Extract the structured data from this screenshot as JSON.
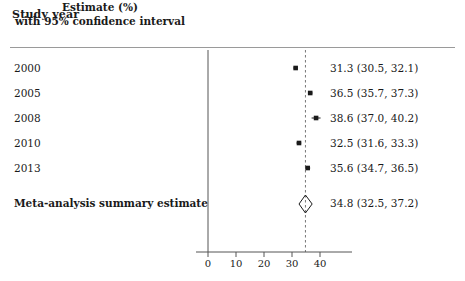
{
  "header": {
    "left_title": "Study year",
    "right_title_line1": "Estimate (%)",
    "right_title_line2": "with 95% confidence interval"
  },
  "chart_data": {
    "type": "forest",
    "title": "",
    "xlabel": "",
    "ylabel": "",
    "xlim": [
      -2,
      48
    ],
    "ticks": [
      0,
      10,
      20,
      30,
      40
    ],
    "tick_labels": [
      "0",
      "10",
      "20",
      "30",
      "40"
    ],
    "grid": false,
    "legend": "none",
    "reference_line_solid": 0,
    "reference_line_dashed": 34.8,
    "row_header": "Study year",
    "value_header": "Estimate (%) with 95% confidence interval",
    "rows": [
      {
        "label": "2000",
        "estimate": 31.3,
        "ci_low": 30.5,
        "ci_high": 32.1,
        "value_text": "31.3 (30.5, 32.1)",
        "marker": "square"
      },
      {
        "label": "2005",
        "estimate": 36.5,
        "ci_low": 35.7,
        "ci_high": 37.3,
        "value_text": "36.5 (35.7, 37.3)",
        "marker": "square"
      },
      {
        "label": "2008",
        "estimate": 38.6,
        "ci_low": 37.0,
        "ci_high": 40.2,
        "value_text": "38.6 (37.0, 40.2)",
        "marker": "square"
      },
      {
        "label": "2010",
        "estimate": 32.5,
        "ci_low": 31.6,
        "ci_high": 33.3,
        "value_text": "32.5 (31.6, 33.3)",
        "marker": "square"
      },
      {
        "label": "2013",
        "estimate": 35.6,
        "ci_low": 34.7,
        "ci_high": 36.5,
        "value_text": "35.6 (34.7, 36.5)",
        "marker": "square"
      }
    ],
    "summary": {
      "label": "Meta-analysis summary estimate",
      "estimate": 34.8,
      "ci_low": 32.5,
      "ci_high": 37.2,
      "value_text": "34.8 (32.5, 37.2)",
      "marker": "diamond"
    }
  },
  "colors": {
    "marker": "#1a1a1a",
    "axis": "#555555",
    "rule": "#9a9a9a",
    "dashed_line": "#777777",
    "text": "#1a1a1a"
  }
}
